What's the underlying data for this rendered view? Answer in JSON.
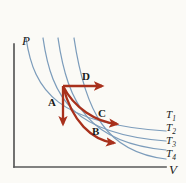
{
  "figure": {
    "type": "pressure-volume-diagram",
    "background_color": "#fbfaf6",
    "axis_color": "#595959",
    "isotherm_color": "#7c9cbb",
    "process_color": "#a8301c"
  },
  "axes": {
    "y_label": "P",
    "x_label": "V",
    "origin": {
      "x": 14,
      "y": 167
    },
    "y_top": 44,
    "x_right": 166
  },
  "isotherms": [
    {
      "label": "T",
      "subscript": "1",
      "label_x": 168,
      "label_y": 110,
      "path": "M 26 38 C 34 92, 58 124, 166 131"
    },
    {
      "label": "T",
      "subscript": "2",
      "label_x": 168,
      "label_y": 123,
      "path": "M 43 38 C 52 100, 74 134, 166 141"
    },
    {
      "label": "T",
      "subscript": "3",
      "label_x": 168,
      "label_y": 136,
      "path": "M 58 38 C 68 106, 90 143, 166 150"
    },
    {
      "label": "T",
      "subscript": "4",
      "label_x": 168,
      "label_y": 149,
      "path": "M 74 38 C 85 112, 106 152, 166 159"
    }
  ],
  "processes": [
    {
      "id": "A",
      "label": "A",
      "label_x": 48,
      "label_y": 99,
      "kind": "vertical-down",
      "path": "M 63 86 L 63 124",
      "start": {
        "x": 63,
        "y": 86
      },
      "end": {
        "x": 63,
        "y": 129
      }
    },
    {
      "id": "B",
      "label": "B",
      "label_x": 92,
      "label_y": 129,
      "kind": "curve",
      "path": "M 63 86 C 72 122, 92 140, 114 143",
      "start": {
        "x": 63,
        "y": 86
      },
      "end": {
        "x": 123,
        "y": 145
      }
    },
    {
      "id": "C",
      "label": "C",
      "label_x": 98,
      "label_y": 112,
      "kind": "curve",
      "path": "M 63 86 C 74 108, 96 122, 117 124",
      "start": {
        "x": 63,
        "y": 86
      },
      "end": {
        "x": 126,
        "y": 126
      }
    },
    {
      "id": "D",
      "label": "D",
      "label_x": 82,
      "label_y": 74,
      "kind": "horizontal-right",
      "path": "M 63 86 L 102 86",
      "start": {
        "x": 63,
        "y": 86
      },
      "end": {
        "x": 110,
        "y": 86
      }
    }
  ],
  "common_state_point": {
    "x": 63,
    "y": 86
  }
}
